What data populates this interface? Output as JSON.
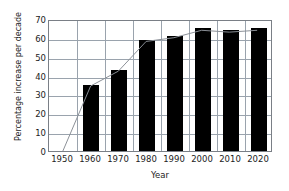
{
  "chart_data": {
    "type": "bar",
    "title": "",
    "subtitle": "",
    "xlabel": "Year",
    "ylabel": "Percentage increase per decade",
    "categories": [
      "1950",
      "1960",
      "1970",
      "1980",
      "1990",
      "2000",
      "2010",
      "2020"
    ],
    "values": [
      0,
      35,
      43,
      59,
      61,
      65,
      64,
      65
    ],
    "series": [
      {
        "name": "Percentage increase per decade",
        "type": "bar",
        "values": [
          0,
          35,
          43,
          59,
          61,
          65,
          64,
          65
        ]
      },
      {
        "name": "trend-line",
        "type": "line",
        "values": [
          0,
          35,
          43,
          59,
          61,
          65,
          64,
          65
        ]
      }
    ],
    "ylim": [
      0,
      70
    ],
    "yticks": [
      0,
      10,
      20,
      30,
      40,
      50,
      60,
      70
    ],
    "ytick_labels": [
      "0",
      "10",
      "20",
      "30",
      "40",
      "50",
      "60",
      "70"
    ],
    "xtick_labels": [
      "1950",
      "1960",
      "1970",
      "1980",
      "1990",
      "2000",
      "2010",
      "2020"
    ],
    "grid": "horizontal-and-vertical",
    "legend": "none",
    "colors": {
      "bar": "#000000",
      "grid": "#9aa3ad",
      "frame": "#7a7f86",
      "line": "#8a8f96",
      "text": "#1c1c1c",
      "background": "#ffffff"
    }
  }
}
